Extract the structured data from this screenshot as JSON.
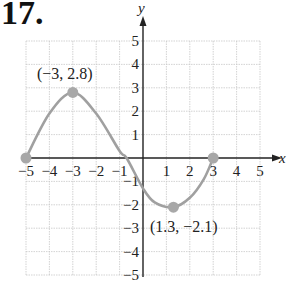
{
  "problem_number": "17.",
  "chart_data": {
    "type": "line",
    "title": "",
    "xlabel": "x",
    "ylabel": "y",
    "xlim": [
      -5,
      5
    ],
    "ylim": [
      -5,
      5
    ],
    "grid": true,
    "x_ticks": [
      "−5",
      "−4",
      "−3",
      "−2",
      "−1",
      "1",
      "2",
      "3",
      "4",
      "5"
    ],
    "y_ticks": [
      "5",
      "4",
      "3",
      "2",
      "1",
      "−1",
      "−2",
      "−3",
      "−4",
      "−5"
    ],
    "series": [
      {
        "name": "curve",
        "color": "#a0a0a0",
        "points": [
          [
            -5,
            0
          ],
          [
            -4,
            1.9
          ],
          [
            -3,
            2.8
          ],
          [
            -2,
            1.9
          ],
          [
            -1,
            0.3
          ],
          [
            -0.7,
            0
          ],
          [
            0,
            -1.3
          ],
          [
            0.5,
            -1.9
          ],
          [
            1.3,
            -2.1
          ],
          [
            2,
            -1.7
          ],
          [
            2.6,
            -0.9
          ],
          [
            3,
            0
          ]
        ]
      }
    ],
    "marked_points": [
      {
        "x": -5,
        "y": 0,
        "label": ""
      },
      {
        "x": -3,
        "y": 2.8,
        "label": "(−3,  2.8)"
      },
      {
        "x": 1.3,
        "y": -2.1,
        "label": "(1.3, −2.1)"
      },
      {
        "x": 3,
        "y": 0,
        "label": ""
      }
    ],
    "annotations": [
      "(−3,  2.8)",
      "(1.3, −2.1)"
    ]
  }
}
